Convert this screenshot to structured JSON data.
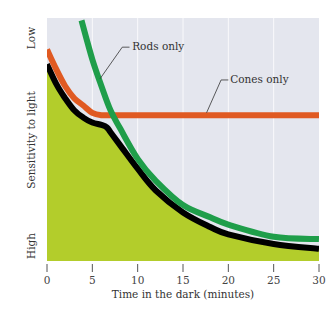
{
  "chart_data": {
    "type": "line",
    "title": "",
    "xlabel": "Time in the dark (minutes)",
    "ylabel": "Sensitivity to light",
    "y_axis_end_labels": {
      "top": "Low",
      "bottom": "High"
    },
    "xlim": [
      0,
      30
    ],
    "ylim": [
      0,
      100
    ],
    "x_ticks": [
      0,
      5,
      10,
      15,
      20,
      25,
      30
    ],
    "grid": {
      "vertical_lines_at": [
        5,
        10,
        15,
        20,
        25
      ],
      "color": "#ffffff"
    },
    "y_scale_note": "Relative threshold scale: 100 = Low sensitivity (top), 0 = High sensitivity (bottom)",
    "series": [
      {
        "name": "Cones only",
        "color": "#e05a22",
        "x": [
          0,
          1,
          2,
          3,
          4,
          5,
          6,
          7,
          10,
          15,
          20,
          25,
          30
        ],
        "values": [
          87,
          79,
          72,
          67,
          64,
          61,
          60,
          60,
          60,
          60,
          60,
          60,
          60
        ]
      },
      {
        "name": "Rods only",
        "color": "#1f9e4a",
        "x": [
          3.8,
          5,
          6,
          7,
          8,
          10,
          12,
          15,
          18,
          20,
          25,
          30
        ],
        "values": [
          99,
          83,
          72,
          62,
          55,
          42,
          33,
          23,
          18,
          15,
          10,
          9
        ]
      },
      {
        "name": "Overall dark adaptation",
        "color": "#000000",
        "x": [
          0,
          1,
          2,
          3,
          4,
          5,
          6,
          6.6,
          7,
          8,
          10,
          12,
          15,
          18,
          20,
          25,
          30
        ],
        "values": [
          81,
          73,
          67,
          62,
          59,
          57,
          56,
          55,
          53,
          48,
          38,
          29,
          20,
          14,
          11,
          7,
          5
        ]
      }
    ],
    "fill_below_overall": {
      "color": "#b3cd2b"
    },
    "plot_background": "#e4e6ee",
    "annotations": [
      {
        "text": "Rods only",
        "points_to": "Rods only",
        "at_x": 5.8
      },
      {
        "text": "Cones only",
        "points_to": "Cones only",
        "at_x": 17.5
      }
    ]
  },
  "labels": {
    "y_top": "Low",
    "y_bottom": "High",
    "y_title": "Sensitivity to light",
    "x_title": "Time in the dark (minutes)",
    "rods": "Rods only",
    "cones": "Cones only"
  }
}
